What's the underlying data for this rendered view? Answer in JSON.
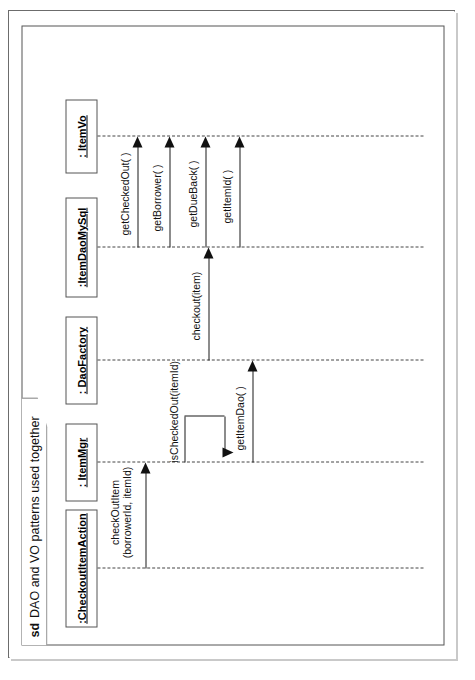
{
  "diagram": {
    "kind": "uml-sequence-diagram",
    "frame_keyword": "sd",
    "frame_title": "DAO and VO patterns used together",
    "orientation": "rotated-90-ccw",
    "colors": {
      "page_background": "#ffffff",
      "page_border": "#6c6c6c",
      "page_shadow": "#c9c9c9",
      "frame_border": "#555555",
      "lifeline_dash": "#444444",
      "message_line": "#1a1a1a",
      "text": "#111111"
    }
  },
  "lifelines": [
    {
      "id": "checkoutitemaction",
      "label": ":CheckoutItemAction"
    },
    {
      "id": "itemmgr",
      "label": ": ItemMgr"
    },
    {
      "id": "daofactory",
      "label": ": DaoFactory"
    },
    {
      "id": "itemdaomysql",
      "label": ":ItemDaoMySql"
    },
    {
      "id": "itemvo",
      "label": ": ItemVo"
    }
  ],
  "messages": [
    {
      "id": "m1",
      "label_line1": "checkOutItem",
      "label_line2": "(borrowerId, itemId)",
      "from": ":CheckoutItemAction",
      "to": ": ItemMgr",
      "kind": "synchronous"
    },
    {
      "id": "m2",
      "label_line1": "isCheckedOut(itemId)",
      "label_line2": "",
      "from": ": ItemMgr",
      "to": ": ItemMgr",
      "kind": "self"
    },
    {
      "id": "m3",
      "label_line1": "getItemDao( )",
      "label_line2": "",
      "from": ": ItemMgr",
      "to": ": DaoFactory",
      "kind": "synchronous"
    },
    {
      "id": "m4",
      "label_line1": "checkout(item)",
      "label_line2": "",
      "from": ": DaoFactory",
      "to": ":ItemDaoMySql",
      "kind": "synchronous"
    },
    {
      "id": "m5",
      "label_line1": "getCheckedOut( )",
      "label_line2": "",
      "from": ":ItemDaoMySql",
      "to": ": ItemVo",
      "kind": "synchronous"
    },
    {
      "id": "m6",
      "label_line1": "getBorrower( )",
      "label_line2": "",
      "from": ":ItemDaoMySql",
      "to": ": ItemVo",
      "kind": "synchronous"
    },
    {
      "id": "m7",
      "label_line1": "getDueBack( )",
      "label_line2": "",
      "from": ":ItemDaoMySql",
      "to": ": ItemVo",
      "kind": "synchronous"
    },
    {
      "id": "m8",
      "label_line1": "getItemId( )",
      "label_line2": "",
      "from": ":ItemDaoMySql",
      "to": ": ItemVo",
      "kind": "synchronous"
    }
  ]
}
